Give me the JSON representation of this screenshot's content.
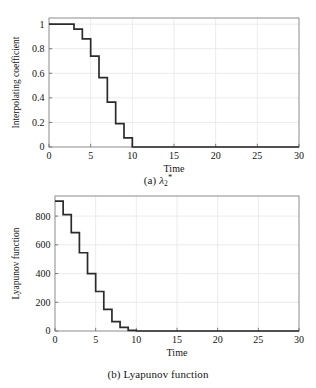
{
  "figure": {
    "panels": [
      {
        "id": "a",
        "caption_prefix": "(a)",
        "caption_symbol": "λ",
        "caption_sub": "2",
        "caption_sup": "*",
        "caption_text": "(a) λ₂*"
      },
      {
        "id": "b",
        "caption_prefix": "(b)",
        "caption_text": "(b) Lyapunov function",
        "caption_label": "Lyapunov function"
      }
    ]
  },
  "chart_data": [
    {
      "type": "line",
      "id": "panel-a",
      "title": "",
      "xlabel": "Time",
      "ylabel": "Interpolating coefficient",
      "xlim": [
        0,
        30
      ],
      "ylim": [
        0,
        1.05
      ],
      "xticks": [
        0,
        5,
        10,
        15,
        20,
        25,
        30
      ],
      "xticklabels": [
        "0",
        "5",
        "10",
        "15",
        "20",
        "25",
        "30"
      ],
      "yticks": [
        0,
        0.2,
        0.4,
        0.6,
        0.8,
        1
      ],
      "yticklabels": [
        "0",
        "0.2",
        "0.4",
        "0.6",
        "0.8",
        "1"
      ],
      "grid": true,
      "legend": null,
      "step": "post",
      "x": [
        0,
        1,
        2,
        3,
        4,
        5,
        6,
        7,
        8,
        9,
        10,
        30
      ],
      "values": [
        1.0,
        1.0,
        1.0,
        0.96,
        0.88,
        0.74,
        0.565,
        0.365,
        0.19,
        0.075,
        0.0,
        0.0
      ]
    },
    {
      "type": "line",
      "id": "panel-b",
      "title": "",
      "xlabel": "Time",
      "ylabel": "Lyapunov function",
      "xlim": [
        0,
        30
      ],
      "ylim": [
        0,
        940
      ],
      "xticks": [
        0,
        5,
        10,
        15,
        20,
        25,
        30
      ],
      "xticklabels": [
        "0",
        "5",
        "10",
        "15",
        "20",
        "25",
        "30"
      ],
      "yticks": [
        0,
        200,
        400,
        600,
        800
      ],
      "yticklabels": [
        "0",
        "200",
        "400",
        "600",
        "800"
      ],
      "grid": true,
      "legend": null,
      "step": "post",
      "x": [
        0,
        1,
        2,
        3,
        4,
        5,
        6,
        7,
        8,
        9,
        10,
        30
      ],
      "values": [
        905,
        810,
        685,
        545,
        400,
        275,
        150,
        65,
        25,
        5,
        0,
        0
      ]
    }
  ]
}
